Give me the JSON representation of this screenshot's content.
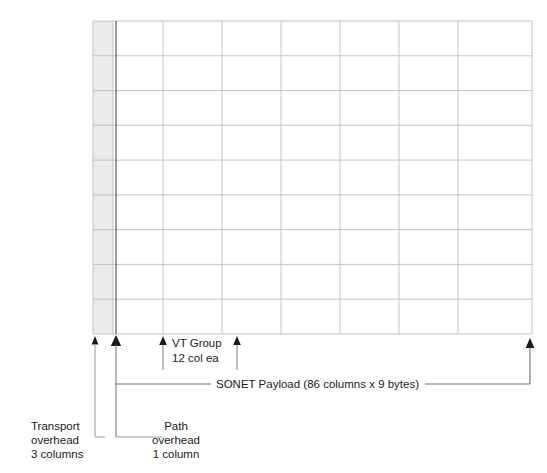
{
  "diagram": {
    "grid": {
      "rows": 9,
      "vt_groups": 7,
      "left": 93,
      "top": 21,
      "right": 532,
      "bottom": 334,
      "payload_left": 115,
      "transport_right": 113,
      "grid_line_color": "#b8b8b8",
      "heavy_line_color": "#555555",
      "shade_color": "#ebebeb"
    },
    "annotations": {
      "vt_group": {
        "line1": "VT Group",
        "line2": "12 col ea",
        "arrow_left_x": 163,
        "arrow_right_x": 237
      },
      "payload": {
        "label": "SONET Payload (86 columns x 9 bytes)"
      },
      "transport_overhead": {
        "line1": "Transport",
        "line2": "overhead",
        "line3": "3 columns"
      },
      "path_overhead": {
        "line1": "Path",
        "line2": "overhead",
        "line3": "1 column"
      }
    }
  }
}
